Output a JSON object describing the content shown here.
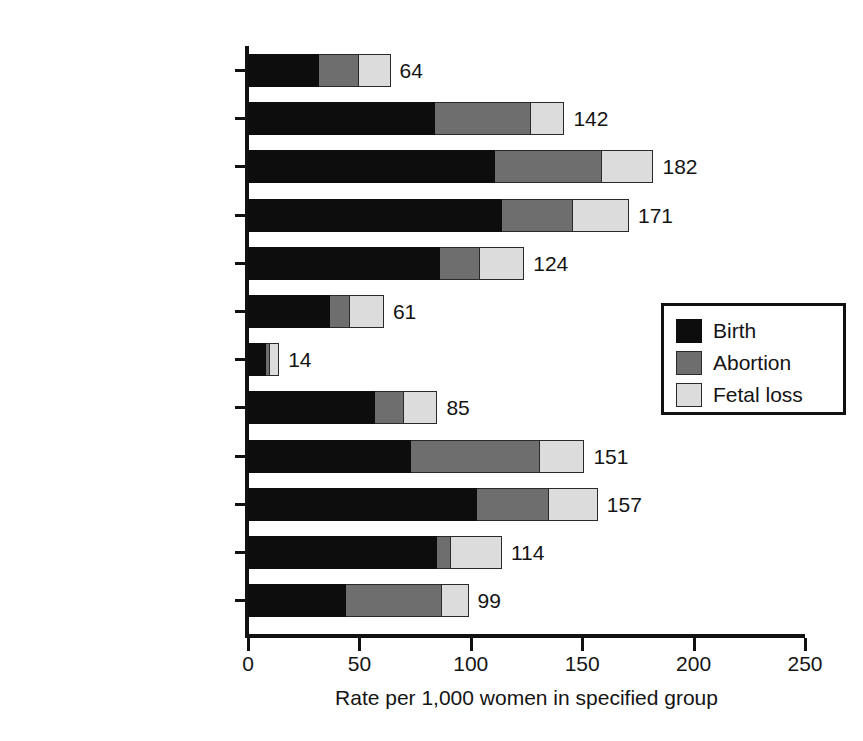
{
  "chart_data": {
    "type": "bar",
    "orientation": "horizontal",
    "stacked": true,
    "title": "",
    "xlabel": "Rate per 1,000 women in specified group",
    "ylabel": "",
    "xlim": [
      0,
      250
    ],
    "xticks": [
      0,
      50,
      100,
      150,
      200,
      250
    ],
    "xtick_labels": [
      "0",
      "50",
      "100",
      "150",
      "200",
      "250"
    ],
    "grid": false,
    "legend_position": "middle-right",
    "categories": [
      "15–17",
      "18–19",
      "20–24",
      "25–29",
      "30–34",
      "35–39",
      "40–44",
      "Non-Hispanic White",
      "Non-Hispanic Black",
      "Hispanic",
      "Married",
      "Unmarried"
    ],
    "series": [
      {
        "name": "Birth",
        "color": "#0d0d0d",
        "values": [
          32,
          84,
          111,
          114,
          86,
          37,
          8,
          57,
          73,
          103,
          85,
          44
        ]
      },
      {
        "name": "Abortion",
        "color": "#6e6e6e",
        "values": [
          18,
          43,
          48,
          32,
          18,
          9,
          2,
          13,
          58,
          32,
          6,
          43
        ]
      },
      {
        "name": "Fetal loss",
        "color": "#dcdcdc",
        "values": [
          14,
          15,
          23,
          25,
          20,
          15,
          4,
          15,
          20,
          22,
          23,
          12
        ]
      }
    ],
    "totals": [
      64,
      142,
      182,
      171,
      124,
      61,
      14,
      85,
      151,
      157,
      114,
      99
    ],
    "total_labels": [
      "64",
      "142",
      "182",
      "171",
      "124",
      "61",
      "14",
      "85",
      "151",
      "157",
      "114",
      "99"
    ]
  },
  "legend": {
    "items": [
      {
        "label": "Birth",
        "color": "#0d0d0d"
      },
      {
        "label": "Abortion",
        "color": "#6e6e6e"
      },
      {
        "label": "Fetal loss",
        "color": "#dcdcdc"
      }
    ]
  }
}
